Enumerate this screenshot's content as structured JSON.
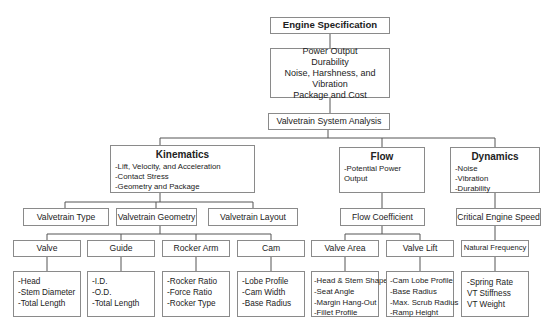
{
  "root": {
    "title": "Engine Specification"
  },
  "requirements": {
    "lines": [
      "Power Output",
      "Durability",
      "Noise, Harshness, and Vibration",
      "Package and Cost"
    ]
  },
  "analysis": {
    "title": "Valvetrain System Analysis"
  },
  "kinematics": {
    "title": "Kinematics",
    "items": [
      "-Lift, Velocity, and Acceleration",
      "-Contact Stress",
      "-Geometry and Package"
    ],
    "children": [
      "Valvetrain Type",
      "Valvetrain Geometry",
      "Valvetrain Layout"
    ],
    "geometry_children": [
      {
        "title": "Valve",
        "items": [
          "-Head",
          "-Stem Diameter",
          "-Total Length"
        ]
      },
      {
        "title": "Guide",
        "items": [
          "-I.D.",
          "-O.D.",
          "-Total Length"
        ]
      },
      {
        "title": "Rocker Arm",
        "items": [
          "-Rocker Ratio",
          "-Force Ratio",
          "-Rocker Type"
        ]
      },
      {
        "title": "Cam",
        "items": [
          "-Lobe Profile",
          "-Cam Width",
          "-Base Radius"
        ]
      }
    ]
  },
  "flow": {
    "title": "Flow",
    "items": [
      "-Potential Power Output"
    ],
    "child": "Flow Coefficient",
    "coefficient_children": [
      {
        "title": "Valve Area",
        "items": [
          "-Head & Stem Shape",
          "-Seat Angle",
          "-Margin Hang-Out",
          "-Fillet Profile"
        ]
      },
      {
        "title": "Valve Lift",
        "items": [
          "-Cam Lobe Profile",
          "-Base Radius",
          "-Max. Scrub Radius",
          "-Ramp Height"
        ]
      }
    ]
  },
  "dynamics": {
    "title": "Dynamics",
    "items": [
      "-Noise",
      "-Vibration",
      "-Durability"
    ],
    "child": "Critical Engine Speed",
    "grandchild": {
      "title": "Natural Frequency",
      "items": [
        "-Spring Rate",
        "VT Stiffness",
        "VT Weight"
      ]
    }
  },
  "colors": {
    "border": "#8a8a8a",
    "line": "#555555",
    "text": "#222222",
    "background": "#ffffff"
  }
}
